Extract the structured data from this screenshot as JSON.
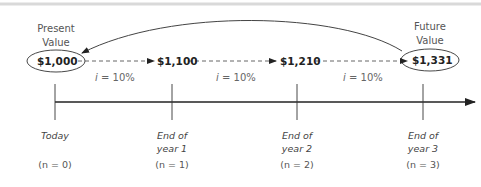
{
  "diagram": {
    "present_value": {
      "heading_line1": "Present",
      "heading_line2": "Value",
      "amount": "$1,000"
    },
    "future_value": {
      "heading_line1": "Future",
      "heading_line2": "Value",
      "amount": "$1,331"
    },
    "intermediate_values": [
      {
        "amount": "$1,100"
      },
      {
        "amount": "$1,210"
      }
    ],
    "rates": [
      {
        "var": "i",
        "text": " = 10%"
      },
      {
        "var": "i",
        "text": " = 10%"
      },
      {
        "var": "i",
        "text": " = 10%"
      }
    ],
    "timeline": [
      {
        "line1": "Today",
        "line2": "",
        "n_label": "(n = 0)"
      },
      {
        "line1": "End of",
        "line2": "year 1",
        "n_label": "(n = 1)"
      },
      {
        "line1": "End of",
        "line2": "year 2",
        "n_label": "(n = 2)"
      },
      {
        "line1": "End of",
        "line2": "year 3",
        "n_label": "(n = 3)"
      }
    ],
    "colors": {
      "line": "#222222",
      "border": "#d9d9d9",
      "text": "#555555"
    }
  }
}
